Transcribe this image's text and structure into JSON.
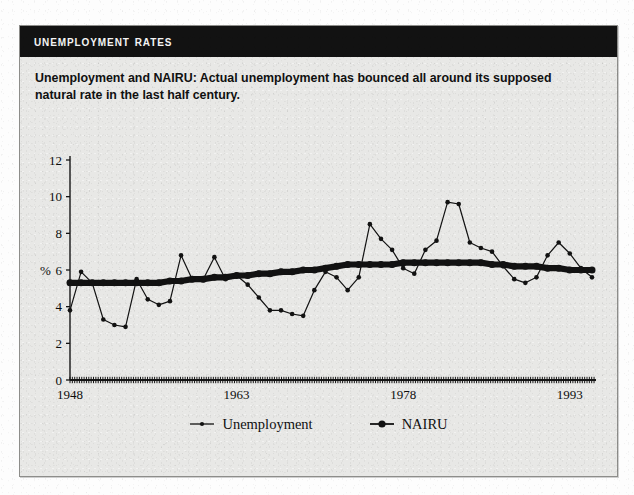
{
  "panel": {
    "title": "Unemployment Rates",
    "caption": "Unemployment and NAIRU: Actual unemployment has bounced all around its supposed natural rate in the last half century."
  },
  "chart_data": {
    "type": "line",
    "title": "Unemployment Rates",
    "subtitle": "Unemployment and NAIRU: Actual unemployment has bounced all around its supposed natural rate in the last half century.",
    "xlabel": "",
    "ylabel": "%",
    "xlim": [
      1948,
      1995
    ],
    "ylim": [
      0,
      12
    ],
    "yticks": [
      0,
      2,
      4,
      6,
      8,
      10,
      12
    ],
    "xticks": [
      1948,
      1963,
      1978,
      1993
    ],
    "xtick_labels": [
      "1948",
      "1963",
      "1978",
      "1993"
    ],
    "grid": false,
    "legend_position": "bottom",
    "x": [
      1948,
      1949,
      1950,
      1951,
      1952,
      1953,
      1954,
      1955,
      1956,
      1957,
      1958,
      1959,
      1960,
      1961,
      1962,
      1963,
      1964,
      1965,
      1966,
      1967,
      1968,
      1969,
      1970,
      1971,
      1972,
      1973,
      1974,
      1975,
      1976,
      1977,
      1978,
      1979,
      1980,
      1981,
      1982,
      1983,
      1984,
      1985,
      1986,
      1987,
      1988,
      1989,
      1990,
      1991,
      1992,
      1993,
      1994,
      1995
    ],
    "series": [
      {
        "name": "Unemployment",
        "marker": "small-dot",
        "values": [
          3.8,
          5.9,
          5.3,
          3.3,
          3.0,
          2.9,
          5.5,
          4.4,
          4.1,
          4.3,
          6.8,
          5.5,
          5.5,
          6.7,
          5.5,
          5.7,
          5.2,
          4.5,
          3.8,
          3.8,
          3.6,
          3.5,
          4.9,
          5.9,
          5.6,
          4.9,
          5.6,
          8.5,
          7.7,
          7.1,
          6.1,
          5.8,
          7.1,
          7.6,
          9.7,
          9.6,
          7.5,
          7.2,
          7.0,
          6.2,
          5.5,
          5.3,
          5.6,
          6.8,
          7.5,
          6.9,
          6.1,
          5.6
        ]
      },
      {
        "name": "NAIRU",
        "marker": "filled-circle",
        "values": [
          5.3,
          5.3,
          5.3,
          5.3,
          5.3,
          5.3,
          5.3,
          5.3,
          5.3,
          5.4,
          5.4,
          5.5,
          5.5,
          5.6,
          5.6,
          5.7,
          5.7,
          5.8,
          5.8,
          5.9,
          5.9,
          6.0,
          6.0,
          6.1,
          6.2,
          6.3,
          6.3,
          6.3,
          6.3,
          6.3,
          6.4,
          6.4,
          6.4,
          6.4,
          6.4,
          6.4,
          6.4,
          6.4,
          6.3,
          6.3,
          6.2,
          6.2,
          6.2,
          6.1,
          6.1,
          6.0,
          6.0,
          6.0
        ]
      }
    ],
    "legend": [
      "Unemployment",
      "NAIRU"
    ]
  }
}
